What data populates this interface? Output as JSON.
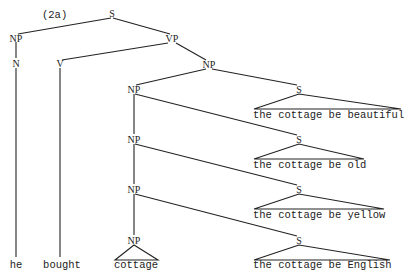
{
  "diagram": {
    "example_label": "(2a)",
    "type": "syntax-tree",
    "nodes": {
      "root": "S",
      "subject_np": "NP",
      "vp": "VP",
      "n": "N",
      "v": "V",
      "object_np": "NP",
      "np1": "NP",
      "np2": "NP",
      "np3": "NP",
      "np4": "NP",
      "s1": "S",
      "s2": "S",
      "s3": "S",
      "s4": "S"
    },
    "leaves": {
      "he": "he",
      "bought": "bought",
      "cottage": "cottage"
    },
    "clauses": [
      "the cottage be beautiful",
      "the cottage be old",
      "the cottage be yellow",
      "the cottage be English"
    ],
    "colors": {
      "ink": "#222222",
      "background": "#ffffff"
    }
  }
}
